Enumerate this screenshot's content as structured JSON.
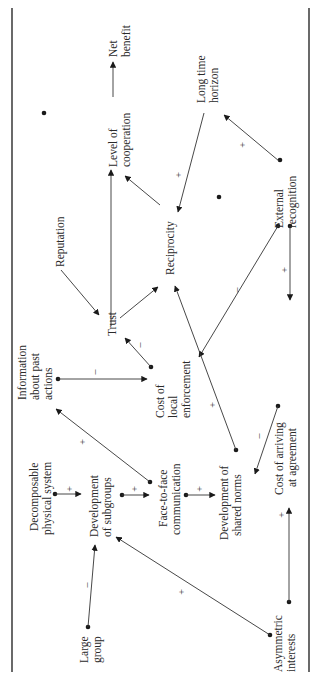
{
  "diagram": {
    "orientation": "rotated-90-ccw",
    "nodes": {
      "net_benefit": [
        "Net",
        "benefit"
      ],
      "level_of_cooperation": [
        "Level of",
        "cooperation"
      ],
      "reputation": [
        "Reputation"
      ],
      "trust": [
        "Trust"
      ],
      "reciprocity": [
        "Reciprocity"
      ],
      "long_time_horizon": [
        "Long time",
        "horizon"
      ],
      "external_recognition": [
        "External",
        "recognition"
      ],
      "information_about_past_actions": [
        "Information",
        "about past",
        "actions"
      ],
      "cost_of_local_enforcement": [
        "Cost of",
        "local",
        "enforcement"
      ],
      "cost_of_arriving_at_agreement": [
        "Cost of arriving",
        "at agreement"
      ],
      "decomposable_physical_system": [
        "Decomposable",
        "physical system"
      ],
      "development_of_subgroups": [
        "Development",
        "of subgroups"
      ],
      "face_to_face_communication": [
        "Face-to-face",
        "communication"
      ],
      "development_of_shared_norms": [
        "Development of",
        "shared norms"
      ],
      "large_group": [
        "Large",
        "group"
      ],
      "asymmetric_interests": [
        "Asymmetric",
        "interests"
      ]
    },
    "edges": [
      {
        "from": "Level of cooperation",
        "to": "Net benefit",
        "sign": ""
      },
      {
        "from": "Trust",
        "to": "Level of cooperation",
        "sign": ""
      },
      {
        "from": "Reciprocity",
        "to": "Level of cooperation",
        "sign": ""
      },
      {
        "from": "Reputation",
        "to": "Trust",
        "sign": ""
      },
      {
        "from": "Trust",
        "to": "Reciprocity",
        "sign": ""
      },
      {
        "from": "Long time horizon",
        "to": "Reciprocity",
        "sign": "+"
      },
      {
        "from": "External recognition",
        "to": "Long time horizon",
        "sign": "+"
      },
      {
        "from": "External recognition",
        "to": "Cost of local enforcement",
        "sign": "–"
      },
      {
        "from": "External recognition",
        "to": "Cost of arriving at agreement",
        "sign": "+"
      },
      {
        "from": "Information about past actions",
        "to": "Cost of local enforcement",
        "sign": "–"
      },
      {
        "from": "Cost of local enforcement",
        "to": "Trust",
        "sign": "–"
      },
      {
        "from": "Development of shared norms",
        "to": "Reciprocity",
        "sign": "+"
      },
      {
        "from": "Face-to-face communication",
        "to": "Information about past actions",
        "sign": "+"
      },
      {
        "from": "Decomposable physical system",
        "to": "Development of subgroups",
        "sign": "+"
      },
      {
        "from": "Development of subgroups",
        "to": "Face-to-face communication",
        "sign": "+"
      },
      {
        "from": "Face-to-face communication",
        "to": "Development of shared norms",
        "sign": "+"
      },
      {
        "from": "Cost of arriving at agreement",
        "to": "Development of shared norms",
        "sign": "–"
      },
      {
        "from": "Large group",
        "to": "Development of subgroups",
        "sign": "–"
      },
      {
        "from": "Asymmetric interests",
        "to": "Development of subgroups",
        "sign": "+"
      },
      {
        "from": "Asymmetric interests",
        "to": "Cost of arriving at agreement",
        "sign": "+"
      }
    ],
    "signs": {
      "plus": "+",
      "minus": "–"
    }
  }
}
